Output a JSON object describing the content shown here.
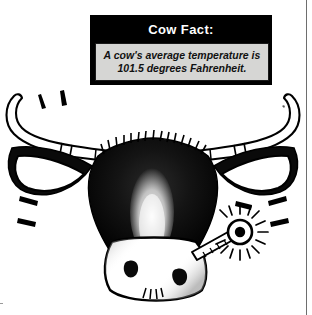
{
  "page": {
    "background_color": "#ffffff",
    "border_color": "#6e6e6e"
  },
  "fact_box": {
    "title": "Cow Fact:",
    "text": "A cow's average temperature is 101.5 degrees Fahrenheit.",
    "header_background": "#000000",
    "header_text_color": "#ffffff",
    "body_background": "#d6d6d4",
    "body_text_color": "#111111"
  },
  "illustration": {
    "caption": "Line-art drawing of a cow head with a thermometer in its mouth",
    "ink_color": "#000000",
    "parts": [
      {
        "name": "left-horn",
        "label": "Left horn"
      },
      {
        "name": "right-horn",
        "label": "Right horn"
      },
      {
        "name": "left-ear",
        "label": "Left ear"
      },
      {
        "name": "right-ear",
        "label": "Right ear"
      },
      {
        "name": "head",
        "label": "Head"
      },
      {
        "name": "forehead-blaze",
        "label": "Forehead blaze"
      },
      {
        "name": "muzzle",
        "label": "Muzzle"
      },
      {
        "name": "left-nostril",
        "label": "Left nostril"
      },
      {
        "name": "right-nostril",
        "label": "Right nostril"
      },
      {
        "name": "thermometer",
        "label": "Thermometer"
      },
      {
        "name": "heat-glow",
        "label": "Heat glow lines"
      },
      {
        "name": "emphasis-marks",
        "label": "Emphasis dashes"
      }
    ]
  }
}
